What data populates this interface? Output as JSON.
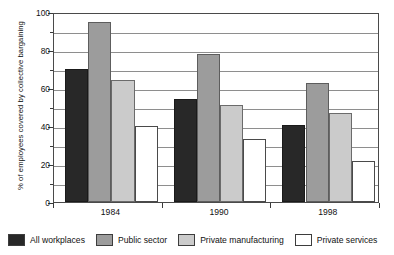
{
  "chart_data": {
    "type": "bar",
    "title": "",
    "xlabel": "",
    "ylabel": "% of employees covered by collective bargaining",
    "categories": [
      "1984",
      "1990",
      "1998"
    ],
    "series": [
      {
        "name": "All workplaces",
        "values": [
          70,
          54,
          40.5
        ],
        "color": "#282828"
      },
      {
        "name": "Public sector",
        "values": [
          95,
          78,
          62.5
        ],
        "color": "#9c9c9c"
      },
      {
        "name": "Private manufacturing",
        "values": [
          64.5,
          51,
          47
        ],
        "color": "#cbcbcb"
      },
      {
        "name": "Private services",
        "values": [
          40,
          33,
          21.5
        ],
        "color": "#ffffff"
      }
    ],
    "ylim": [
      0,
      100
    ],
    "ytick_labels": [
      "0",
      "20",
      "40",
      "60",
      "80",
      "100"
    ],
    "ytick_values": [
      0,
      20,
      40,
      60,
      80,
      100
    ],
    "minor_tick_values": [
      10,
      30,
      50,
      70,
      90
    ],
    "gridlines": [
      10,
      20,
      30,
      40,
      50,
      60,
      70,
      80,
      90
    ],
    "grid": true,
    "legend_position": "bottom"
  },
  "legend": {
    "items": [
      {
        "label": "All workplaces"
      },
      {
        "label": "Public sector"
      },
      {
        "label": "Private manufacturing"
      },
      {
        "label": "Private services"
      }
    ]
  }
}
